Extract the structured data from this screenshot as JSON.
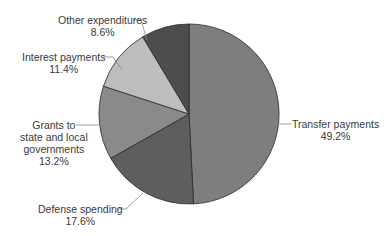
{
  "chart_data": {
    "type": "pie",
    "title": "",
    "categories": [
      "Transfer payments",
      "Defense spending",
      "Grants to state and local governments",
      "Interest payments",
      "Other expenditures"
    ],
    "values": [
      49.2,
      17.6,
      13.2,
      11.4,
      8.6
    ],
    "unit": "%",
    "start_angle_deg": 0,
    "direction": "clockwise",
    "colors": [
      "#7e7e7e",
      "#5e5e5e",
      "#8a8a8a",
      "#bdbdbd",
      "#4d4d4d"
    ],
    "legend": "none (callout labels)"
  },
  "labels": {
    "transfer": {
      "name": "Transfer payments",
      "pct": "49.2%"
    },
    "defense": {
      "name": "Defense spending",
      "pct": "17.6%"
    },
    "grants": {
      "line1": "Grants to",
      "line2": "state and local",
      "line3": "governments",
      "pct": "13.2%"
    },
    "interest": {
      "name": "Interest payments",
      "pct": "11.4%"
    },
    "other": {
      "name": "Other expenditures",
      "pct": "8.6%"
    }
  }
}
